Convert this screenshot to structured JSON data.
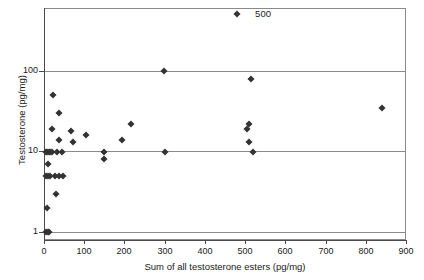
{
  "chart_data": {
    "type": "scatter",
    "title": "",
    "xlabel": "Sum of all testosterone esters (pg/mg)",
    "ylabel": "Testosterone (pg/mg)",
    "xlim": [
      0,
      900
    ],
    "ylim": [
      0.8,
      600
    ],
    "yscale": "log",
    "xscale": "linear",
    "grid": "horizontal-decades",
    "legend": "none",
    "xticks": [
      0,
      100,
      200,
      300,
      400,
      500,
      600,
      700,
      800,
      900
    ],
    "xtick_labels": [
      "0",
      "100",
      "200",
      "300",
      "400",
      "500",
      "600",
      "700",
      "800",
      "900"
    ],
    "yticks": [
      1,
      10,
      100
    ],
    "ytick_labels": [
      "1",
      "10",
      "100"
    ],
    "marker": "diamond",
    "marker_color": "#333333",
    "frame_color": "#8a8a8a",
    "points": [
      {
        "x": 5,
        "y": 1
      },
      {
        "x": 9,
        "y": 1
      },
      {
        "x": 13,
        "y": 1
      },
      {
        "x": 8,
        "y": 2
      },
      {
        "x": 30,
        "y": 3
      },
      {
        "x": 4,
        "y": 5
      },
      {
        "x": 9,
        "y": 5
      },
      {
        "x": 14,
        "y": 5
      },
      {
        "x": 26,
        "y": 5
      },
      {
        "x": 38,
        "y": 5
      },
      {
        "x": 47,
        "y": 5
      },
      {
        "x": 11,
        "y": 7
      },
      {
        "x": 4,
        "y": 10
      },
      {
        "x": 8,
        "y": 10
      },
      {
        "x": 12,
        "y": 10
      },
      {
        "x": 16,
        "y": 10
      },
      {
        "x": 21,
        "y": 10
      },
      {
        "x": 32,
        "y": 10
      },
      {
        "x": 44,
        "y": 10
      },
      {
        "x": 150,
        "y": 10
      },
      {
        "x": 150,
        "y": 8
      },
      {
        "x": 300,
        "y": 10
      },
      {
        "x": 520,
        "y": 10
      },
      {
        "x": 38,
        "y": 14
      },
      {
        "x": 72,
        "y": 13
      },
      {
        "x": 195,
        "y": 14
      },
      {
        "x": 510,
        "y": 13
      },
      {
        "x": 20,
        "y": 19
      },
      {
        "x": 68,
        "y": 18
      },
      {
        "x": 105,
        "y": 16
      },
      {
        "x": 215,
        "y": 22
      },
      {
        "x": 505,
        "y": 19
      },
      {
        "x": 510,
        "y": 22
      },
      {
        "x": 840,
        "y": 35
      },
      {
        "x": 36,
        "y": 30
      },
      {
        "x": 22,
        "y": 50
      },
      {
        "x": 515,
        "y": 80
      },
      {
        "x": 298,
        "y": 100
      },
      {
        "x": 480,
        "y": 500
      }
    ],
    "annotations": [
      {
        "text": "500",
        "x": 500,
        "y": 500,
        "dx": 10,
        "dy": 0
      }
    ]
  }
}
